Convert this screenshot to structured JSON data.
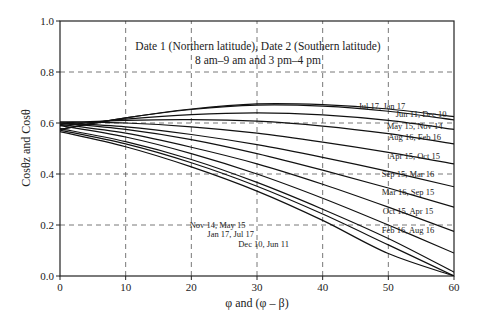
{
  "chart_data": {
    "type": "line",
    "title": "Date 1 (Northern latitude), Date 2 (Southern latitude)",
    "subtitle": "8 am–9 am  and  3 pm–4 pm",
    "xlabel": "φ and (φ – β)",
    "ylabel": "Cosθz and Cosθ",
    "xlim": [
      0,
      60
    ],
    "ylim": [
      0.0,
      1.0
    ],
    "xticks": [
      "0",
      "10",
      "20",
      "30",
      "40",
      "50",
      "60"
    ],
    "yticks": [
      "0.0",
      "0.2",
      "0.4",
      "0.6",
      "0.8",
      "1.0"
    ],
    "grid": true,
    "legend_position": "inline labels",
    "x": [
      0,
      10,
      20,
      30,
      40,
      50,
      60
    ],
    "series": [
      {
        "name": "Jul 17, Jan 17",
        "values": [
          0.575,
          0.62,
          0.655,
          0.675,
          0.672,
          0.655,
          0.625
        ]
      },
      {
        "name": "Jun 11, Dec 10",
        "values": [
          0.575,
          0.62,
          0.653,
          0.67,
          0.666,
          0.646,
          0.612
        ]
      },
      {
        "name": "May 15, Nov 14",
        "values": [
          0.59,
          0.615,
          0.633,
          0.64,
          0.632,
          0.61,
          0.575
        ]
      },
      {
        "name": "Aug 16, Feb 16",
        "values": [
          0.6,
          0.61,
          0.613,
          0.607,
          0.588,
          0.558,
          0.518
        ]
      },
      {
        "name": "Apr 15, Oct 15",
        "values": [
          0.605,
          0.6,
          0.585,
          0.56,
          0.525,
          0.485,
          0.44
        ]
      },
      {
        "name": "Sep 15, Mar 16",
        "values": [
          0.6,
          0.585,
          0.555,
          0.515,
          0.465,
          0.41,
          0.35
        ]
      },
      {
        "name": "Mar 16, Sep 15",
        "values": [
          0.6,
          0.575,
          0.535,
          0.48,
          0.415,
          0.345,
          0.27
        ]
      },
      {
        "name": "Oct 15, Apr 15",
        "values": [
          0.595,
          0.56,
          0.505,
          0.44,
          0.36,
          0.27,
          0.175
        ]
      },
      {
        "name": "Feb 16, Aug 16",
        "values": [
          0.59,
          0.545,
          0.48,
          0.4,
          0.305,
          0.2,
          0.09
        ]
      },
      {
        "name": "Nov 14, May 15",
        "values": [
          0.578,
          0.527,
          0.457,
          0.367,
          0.262,
          0.147,
          0.015
        ]
      },
      {
        "name": "Jan 17, Jul 17",
        "values": [
          0.572,
          0.518,
          0.444,
          0.352,
          0.243,
          0.122,
          0.0
        ]
      },
      {
        "name": "Dec 10, Jun 11",
        "values": [
          0.566,
          0.507,
          0.428,
          0.333,
          0.218,
          0.088,
          0.0
        ]
      }
    ],
    "annotations": [
      {
        "text": "Jul 17, Jan 17",
        "x": 49,
        "y": 0.665
      },
      {
        "text": "Jun 11, Dec 10",
        "x": 55,
        "y": 0.635
      },
      {
        "text": "May 15, Nov 14",
        "x": 54,
        "y": 0.59
      },
      {
        "text": "Aug 16, Feb 16",
        "x": 54,
        "y": 0.545
      },
      {
        "text": "Apr 15, Oct 15",
        "x": 54,
        "y": 0.47
      },
      {
        "text": "Sep 15, Mar 16",
        "x": 53,
        "y": 0.4
      },
      {
        "text": "Mar 16, Sep 15",
        "x": 53,
        "y": 0.33
      },
      {
        "text": "Oct 15, Apr 15",
        "x": 53,
        "y": 0.255
      },
      {
        "text": "Feb 16, Aug 16",
        "x": 53,
        "y": 0.18
      },
      {
        "text": "Nov 14, May 15",
        "x": 24,
        "y": 0.2
      },
      {
        "text": "Jan 17, Jul 17",
        "x": 26,
        "y": 0.165
      },
      {
        "text": "Dec 10, Jun 11",
        "x": 31,
        "y": 0.125
      }
    ]
  }
}
